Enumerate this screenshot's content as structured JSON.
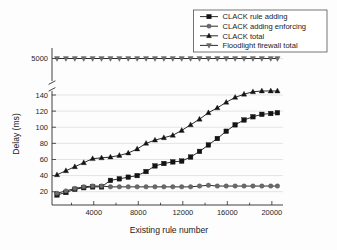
{
  "chart_data": {
    "type": "line",
    "title": "",
    "xlabel": "Existing rule number",
    "ylabel": "Delay (ms)",
    "xlim": [
      250,
      21000
    ],
    "ylim": [
      10,
      150
    ],
    "grid": true,
    "legend_position": "top-right",
    "axis_break": {
      "present": true,
      "below": 150,
      "above_label": "5000"
    },
    "xticks": [
      4000,
      8000,
      12000,
      16000,
      20000
    ],
    "xtick_labels": [
      "4000",
      "8000",
      "12000",
      "16000",
      "20000"
    ],
    "xminor_ticks": [
      2000,
      6000,
      10000,
      14000,
      18000
    ],
    "yticks": [
      20,
      40,
      60,
      80,
      100,
      120,
      140
    ],
    "ytick_labels": [
      "20",
      "40",
      "60",
      "80",
      "100",
      "120",
      "140"
    ],
    "ybreak_tick": 5000,
    "ybreak_tick_label": "5000",
    "x": [
      700,
      1500,
      2300,
      3100,
      3900,
      4700,
      5500,
      6300,
      7100,
      7900,
      8700,
      9500,
      10300,
      11100,
      11900,
      12700,
      13500,
      14300,
      15100,
      15900,
      16700,
      17500,
      18300,
      19100,
      19900,
      20500
    ],
    "series": [
      {
        "name": "CLACK rule adding",
        "marker": "square",
        "values": [
          16,
          19,
          23,
          25,
          26,
          26,
          34,
          36,
          38,
          40,
          45,
          52,
          55,
          57,
          58,
          63,
          70,
          78,
          86,
          95,
          103,
          109,
          113,
          116,
          117,
          118
        ]
      },
      {
        "name": "CLACK adding enforcing",
        "marker": "circle",
        "values": [
          18,
          21,
          24,
          26,
          27,
          27,
          26,
          26,
          26,
          26,
          26,
          26,
          26,
          26,
          26,
          26,
          27,
          28,
          27,
          27,
          27,
          27,
          27,
          27,
          27,
          27
        ]
      },
      {
        "name": "CLACK total",
        "marker": "triangle-up",
        "values": [
          41,
          46,
          51,
          56,
          61,
          62,
          63,
          65,
          68,
          73,
          80,
          84,
          87,
          90,
          96,
          103,
          110,
          118,
          124,
          131,
          137,
          141,
          144,
          145,
          145,
          145
        ]
      },
      {
        "name": "Floodlight firewall total",
        "marker": "triangle-down",
        "values": [
          5000,
          5000,
          5000,
          5000,
          5000,
          5000,
          5000,
          5000,
          5000,
          5000,
          5000,
          5000,
          5000,
          5000,
          5000,
          5000,
          5000,
          5000,
          5000,
          5000,
          5000,
          5000,
          5000,
          5000,
          5000,
          5000
        ]
      }
    ],
    "colors": {
      "line": "#141414",
      "marker_dark": "#141414",
      "marker_gray": "#6a6a6a",
      "grid": "#c9c9c9",
      "frame": "#2b2b2b"
    }
  },
  "legend": {
    "items": [
      {
        "label": "CLACK rule adding",
        "marker": "square"
      },
      {
        "label": "CLACK adding enforcing",
        "marker": "circle"
      },
      {
        "label": "CLACK total",
        "marker": "triangle-up"
      },
      {
        "label": "Floodlight firewall total",
        "marker": "triangle-down"
      }
    ]
  }
}
